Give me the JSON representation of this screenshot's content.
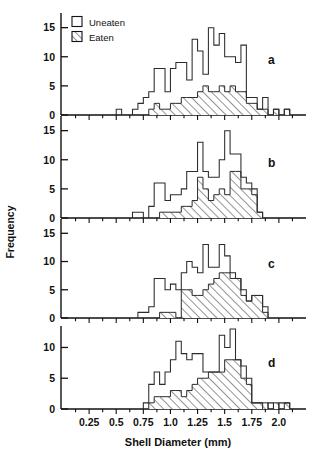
{
  "figure": {
    "x_axis_label": "Shell Diameter (mm)",
    "y_axis_label": "Frequency",
    "legend": [
      {
        "key": "uneaten",
        "label": "Uneaten",
        "swatch": "open-square"
      },
      {
        "key": "eaten",
        "label": "Eaten",
        "swatch": "hatched-square"
      }
    ],
    "panel_letters": [
      "a",
      "b",
      "c",
      "d"
    ]
  },
  "chart_data": {
    "type": "bar",
    "title": "",
    "subtitle": "",
    "xlabel": "Shell Diameter (mm)",
    "ylabel": "Frequency",
    "xlim": [
      0,
      2.25
    ],
    "grid": false,
    "legend_position": "top-left",
    "legend_entries": [
      "Uneaten",
      "Eaten"
    ],
    "xticks": [
      0.25,
      0.5,
      0.75,
      1.0,
      1.25,
      1.5,
      1.75,
      2.0
    ],
    "xtick_labels": [
      "0.25",
      "0.5",
      "0.75",
      "1.0",
      "1.25",
      "1.5",
      "1.75",
      "2.0"
    ],
    "x_minor_tick_step": 0.125,
    "bin_width": 0.05,
    "bin_start": 0.0,
    "panels": [
      {
        "letter": "a",
        "ylim": [
          0,
          17
        ],
        "yticks": [
          0,
          5,
          10,
          15
        ],
        "ytick_labels": [
          "0",
          "5",
          "10",
          "15"
        ],
        "series": [
          {
            "name": "Uneaten",
            "bin_centers": [
              0.525,
              0.575,
              0.625,
              0.675,
              0.725,
              0.775,
              0.825,
              0.875,
              0.925,
              0.975,
              1.025,
              1.075,
              1.125,
              1.175,
              1.225,
              1.275,
              1.325,
              1.375,
              1.425,
              1.475,
              1.525,
              1.575,
              1.625,
              1.675,
              1.725,
              1.775,
              1.825,
              1.875,
              1.925,
              1.975,
              2.025,
              2.075
            ],
            "values": [
              1,
              0,
              0,
              1,
              2,
              3,
              4,
              8,
              8,
              4,
              8,
              9,
              9,
              6,
              13,
              11,
              7,
              15,
              12,
              14,
              10,
              10,
              9,
              12,
              3,
              3,
              1,
              3,
              0,
              1,
              0,
              1
            ]
          },
          {
            "name": "Eaten",
            "bin_centers": [
              0.825,
              0.875,
              0.925,
              0.975,
              1.025,
              1.075,
              1.125,
              1.175,
              1.225,
              1.275,
              1.325,
              1.375,
              1.425,
              1.475,
              1.525,
              1.575,
              1.625,
              1.675,
              1.725,
              1.775,
              1.825,
              1.875,
              1.925,
              1.975,
              2.025,
              2.075
            ],
            "values": [
              1,
              2,
              1,
              1,
              2,
              2,
              3,
              3,
              3,
              4,
              5,
              4,
              4,
              5,
              4,
              5,
              4,
              4,
              2,
              2,
              1,
              1,
              0,
              1,
              0,
              1
            ]
          }
        ]
      },
      {
        "letter": "b",
        "ylim": [
          0,
          17
        ],
        "yticks": [
          0,
          5,
          10,
          15
        ],
        "ytick_labels": [
          "0",
          "5",
          "10",
          "15"
        ],
        "series": [
          {
            "name": "Uneaten",
            "bin_centers": [
              0.675,
              0.725,
              0.775,
              0.825,
              0.875,
              0.925,
              0.975,
              1.025,
              1.075,
              1.125,
              1.175,
              1.225,
              1.275,
              1.325,
              1.375,
              1.425,
              1.475,
              1.525,
              1.575,
              1.625,
              1.675,
              1.725,
              1.775,
              1.825
            ],
            "values": [
              1,
              1,
              0,
              2,
              6,
              6,
              3,
              4,
              4,
              5,
              8,
              8,
              13,
              8,
              7,
              7,
              10,
              15,
              11,
              11,
              7,
              6,
              5,
              1
            ]
          },
          {
            "name": "Eaten",
            "bin_centers": [
              0.925,
              0.975,
              1.025,
              1.075,
              1.125,
              1.175,
              1.225,
              1.275,
              1.325,
              1.375,
              1.425,
              1.475,
              1.525,
              1.575,
              1.625,
              1.675,
              1.725,
              1.775,
              1.825
            ],
            "values": [
              1,
              1,
              1,
              1,
              2,
              2,
              3,
              7,
              5,
              3,
              4,
              5,
              4,
              8,
              8,
              5,
              5,
              4,
              1
            ]
          }
        ]
      },
      {
        "letter": "c",
        "ylim": [
          0,
          17
        ],
        "yticks": [
          0,
          5,
          10,
          15
        ],
        "ytick_labels": [
          "0",
          "5",
          "10",
          "15"
        ],
        "series": [
          {
            "name": "Uneaten",
            "bin_centers": [
              0.725,
              0.775,
              0.825,
              0.875,
              0.925,
              0.975,
              1.025,
              1.075,
              1.125,
              1.175,
              1.225,
              1.275,
              1.325,
              1.375,
              1.425,
              1.475,
              1.525,
              1.575,
              1.625,
              1.675,
              1.725,
              1.775,
              1.825,
              1.875
            ],
            "values": [
              1,
              1,
              2,
              7,
              7,
              5,
              6,
              5,
              8,
              10,
              9,
              8,
              13,
              9,
              9,
              13,
              11,
              8,
              7,
              5,
              3,
              4,
              4,
              2
            ]
          },
          {
            "name": "Eaten",
            "bin_centers": [
              0.875,
              0.925,
              0.975,
              1.025,
              1.075,
              1.125,
              1.175,
              1.225,
              1.275,
              1.325,
              1.375,
              1.425,
              1.475,
              1.525,
              1.575,
              1.625,
              1.675,
              1.725,
              1.775,
              1.825,
              1.875
            ],
            "values": [
              0,
              1,
              1,
              1,
              0,
              5,
              5,
              4,
              4,
              5,
              6,
              7,
              8,
              8,
              7,
              7,
              4,
              3,
              4,
              4,
              1
            ]
          }
        ]
      },
      {
        "letter": "d",
        "ylim": [
          0,
          13
        ],
        "yticks": [
          0,
          5,
          10
        ],
        "ytick_labels": [
          "0",
          "5",
          "10"
        ],
        "series": [
          {
            "name": "Uneaten",
            "bin_centers": [
              0.775,
              0.825,
              0.875,
              0.925,
              0.975,
              1.025,
              1.075,
              1.125,
              1.175,
              1.225,
              1.275,
              1.325,
              1.375,
              1.425,
              1.475,
              1.525,
              1.575,
              1.625,
              1.675,
              1.725,
              1.775,
              1.825,
              1.875,
              1.925,
              1.975,
              2.025,
              2.075
            ],
            "values": [
              1,
              4,
              6,
              4,
              6,
              8,
              11,
              9,
              8,
              9,
              9,
              6,
              6,
              6,
              12,
              10,
              13,
              8,
              7,
              5,
              1,
              1,
              0,
              1,
              0,
              1,
              1
            ]
          },
          {
            "name": "Eaten",
            "bin_centers": [
              0.825,
              0.875,
              0.925,
              0.975,
              1.025,
              1.075,
              1.125,
              1.175,
              1.225,
              1.275,
              1.325,
              1.375,
              1.425,
              1.475,
              1.525,
              1.575,
              1.625,
              1.675,
              1.725,
              1.775,
              1.825,
              1.875,
              1.925,
              1.975,
              2.025,
              2.075
            ],
            "values": [
              1,
              2,
              2,
              2,
              3,
              3,
              2,
              3,
              4,
              5,
              5,
              6,
              6,
              6,
              8,
              8,
              8,
              5,
              4,
              1,
              1,
              1,
              0,
              1,
              0,
              1
            ]
          }
        ]
      }
    ]
  }
}
